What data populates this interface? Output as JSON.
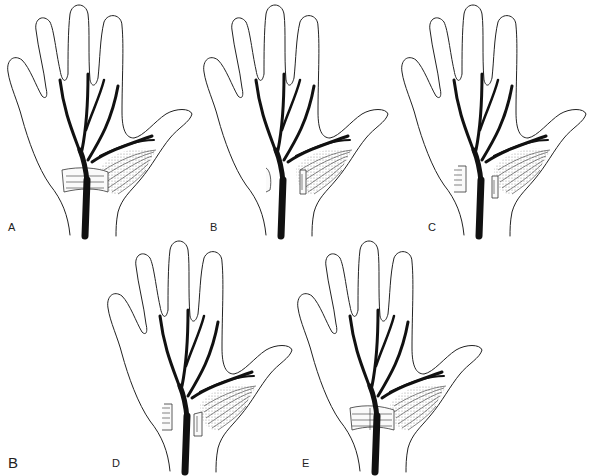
{
  "figure": {
    "part_label": "B",
    "panels": [
      {
        "id": "A",
        "label": "A",
        "ligament": "intact",
        "position": {
          "x": 0,
          "y": 0
        }
      },
      {
        "id": "B",
        "label": "B",
        "ligament": "divided",
        "position": {
          "x": 196,
          "y": 0
        }
      },
      {
        "id": "C",
        "label": "C",
        "ligament": "divided-retracted",
        "position": {
          "x": 394,
          "y": 0
        }
      },
      {
        "id": "D",
        "label": "D",
        "ligament": "divided-retracted",
        "position": {
          "x": 96,
          "y": 236
        }
      },
      {
        "id": "E",
        "label": "E",
        "ligament": "reconstructed",
        "position": {
          "x": 290,
          "y": 236
        }
      }
    ],
    "colors": {
      "line": "#222222",
      "nerve": "#111111",
      "background": "#ffffff",
      "muscle_stipple": "#e2e2e2"
    }
  }
}
